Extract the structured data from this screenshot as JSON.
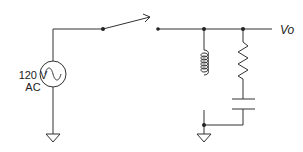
{
  "diagram": {
    "type": "circuit-schematic",
    "source": {
      "label_line1": "120 V",
      "label_line2": "AC",
      "symbol": "ac-voltage-source"
    },
    "switch": {
      "state": "open"
    },
    "output": {
      "label": "Vo"
    },
    "components": [
      "ac-source",
      "switch",
      "inductor",
      "resistor",
      "capacitor",
      "ground",
      "ground"
    ],
    "stroke_color": "#333333"
  }
}
